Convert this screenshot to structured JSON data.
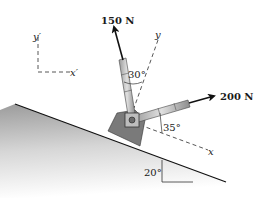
{
  "diagram": {
    "forces": [
      {
        "label": "150 N",
        "magnitude": 150,
        "unit": "N"
      },
      {
        "label": "200 N",
        "magnitude": 200,
        "unit": "N"
      }
    ],
    "angles": {
      "force1_from_y": "30°",
      "force2_from_x": "35°",
      "incline": "20°"
    },
    "axes": {
      "rotated": {
        "x": "x",
        "y": "y"
      },
      "reference": {
        "x": "x′",
        "y": "y′"
      }
    }
  }
}
